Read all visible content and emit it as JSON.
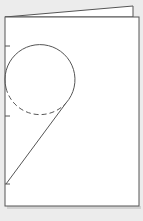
{
  "diagram": {
    "colors": {
      "background": "#ececec",
      "paper": "#ffffff",
      "line": "#555555",
      "shadow": "#9a9a9a"
    },
    "back_panel": {
      "points": "5,17 133,6 133,17"
    },
    "front_panel": {
      "x": 5,
      "y": 17,
      "width": 134,
      "height": 189
    },
    "ticks": [
      46,
      116,
      184
    ],
    "circle": {
      "cx": 40,
      "cy": 80,
      "r": 35
    },
    "solid_arc": "M 6 88 A 35 35 0 1 1 66 103",
    "dashed_arc": "M 6 88 A 35 35 0 0 0 66 103",
    "diagonal": {
      "x1": 66,
      "y1": 103,
      "x2": 6,
      "y2": 184
    }
  }
}
